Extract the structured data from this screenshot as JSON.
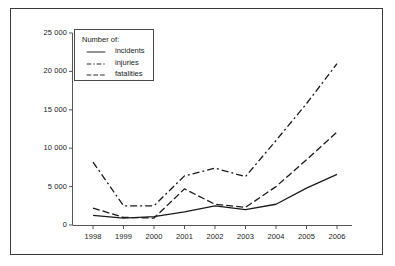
{
  "chart_data": {
    "type": "line",
    "title": "",
    "xlabel": "",
    "ylabel": "",
    "categories": [
      "1998",
      "1999",
      "2000",
      "2001",
      "2002",
      "2003",
      "2004",
      "2005",
      "2006"
    ],
    "ylim": [
      0,
      25000
    ],
    "yticks": [
      0,
      5000,
      10000,
      15000,
      20000,
      25000
    ],
    "ytick_labels": [
      "0",
      "5 000",
      "10 000",
      "15 000",
      "20 000",
      "25 000"
    ],
    "grid": false,
    "legend_position": "top-left",
    "legend_title": "Number of:",
    "series": [
      {
        "name": "incidents",
        "style": "solid",
        "values": [
          1250,
          900,
          1100,
          1700,
          2500,
          2000,
          2700,
          4800,
          6600
        ]
      },
      {
        "name": "injuries",
        "style": "dash-dot",
        "values": [
          8200,
          2500,
          2500,
          6400,
          7400,
          6300,
          11000,
          15800,
          21000
        ]
      },
      {
        "name": "fatalities",
        "style": "dashed",
        "values": [
          2200,
          1000,
          900,
          4700,
          2700,
          2300,
          5000,
          8500,
          12100
        ]
      }
    ]
  },
  "legend": {
    "title": "Number of:",
    "entries": [
      {
        "label": "incidents",
        "style": "solid"
      },
      {
        "label": "injuries",
        "style": "dash-dot"
      },
      {
        "label": "fatalities",
        "style": "dashed"
      }
    ]
  }
}
